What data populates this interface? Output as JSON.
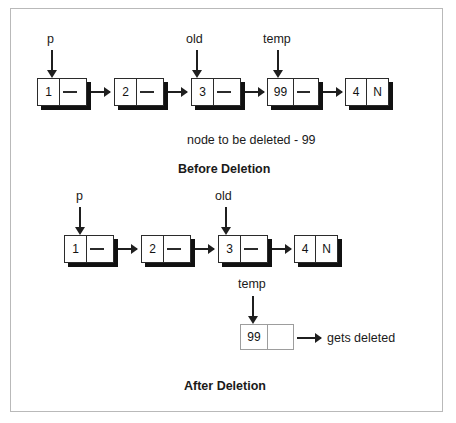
{
  "figure": {
    "title_before": "Before Deletion",
    "title_after": "After Deletion",
    "note_before": "node to be deleted - 99",
    "note_deleted": "gets deleted",
    "null_marker": "N"
  },
  "before": {
    "section_label": "Before Deletion",
    "note": "node to be deleted - 99",
    "nodes": [
      {
        "value": "1",
        "link": "",
        "terminal": false
      },
      {
        "value": "2",
        "link": "",
        "terminal": false
      },
      {
        "value": "3",
        "link": "",
        "terminal": false
      },
      {
        "value": "99",
        "link": "",
        "terminal": false
      },
      {
        "value": "4",
        "link": "N",
        "terminal": true
      }
    ],
    "pointers": [
      {
        "name": "p",
        "target_value": "1"
      },
      {
        "name": "old",
        "target_value": "3"
      },
      {
        "name": "temp",
        "target_value": "99"
      }
    ]
  },
  "after": {
    "section_label": "After Deletion",
    "nodes": [
      {
        "value": "1",
        "link": "",
        "terminal": false
      },
      {
        "value": "2",
        "link": "",
        "terminal": false
      },
      {
        "value": "3",
        "link": "",
        "terminal": false
      },
      {
        "value": "4",
        "link": "N",
        "terminal": true
      }
    ],
    "pointers": [
      {
        "name": "p",
        "target_value": "1"
      },
      {
        "name": "old",
        "target_value": "3"
      }
    ],
    "detached": {
      "pointer_name": "temp",
      "value": "99",
      "link": "",
      "note": "gets deleted"
    }
  },
  "colors": {
    "line": "#1f1f1f",
    "shadow": "#111111",
    "ghost_border": "#9d9d9d",
    "frame": "#b9b9b9",
    "background": "#ffffff"
  }
}
